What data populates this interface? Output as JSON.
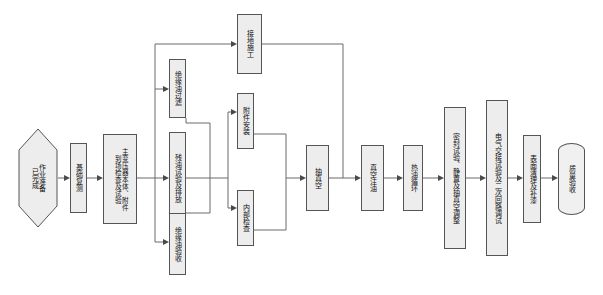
{
  "diagram": {
    "orientation": "left-to-right, vertical CJK text",
    "style": {
      "node_fill": "#ededed",
      "node_border": "#555555",
      "wire_color": "#6b6b6b",
      "arrow_color": "#4a4a4a",
      "background": "#ffffff"
    }
  },
  "nodes": {
    "start": {
      "label": "作业准备\n已完成",
      "shape": "hexagon"
    },
    "n1": {
      "label": "基础复测",
      "shape": "process"
    },
    "n2": {
      "label": "主变压器本体、附件\n到场检查及试验",
      "shape": "process"
    },
    "n3": {
      "label": "接地施工",
      "shape": "process"
    },
    "n4": {
      "label": "绝缘油过滤",
      "shape": "process"
    },
    "n5": {
      "label": "残油试验及排放",
      "shape": "process"
    },
    "n6": {
      "label": "绝缘油验收",
      "shape": "process"
    },
    "n7": {
      "label": "附件安装",
      "shape": "process"
    },
    "n8": {
      "label": "内部检查",
      "shape": "process"
    },
    "n9": {
      "label": "抽真空",
      "shape": "process"
    },
    "n10": {
      "label": "真空注油",
      "shape": "process"
    },
    "n11": {
      "label": "热油循环",
      "shape": "process"
    },
    "n12": {
      "label": "密封试验、静置及抽真空调整",
      "shape": "process"
    },
    "n13": {
      "label": "电气交接试验及二次回路调试",
      "shape": "process"
    },
    "n14": {
      "label": "表面清理及补漆",
      "shape": "process"
    },
    "end": {
      "label": "质量验收",
      "shape": "terminal"
    }
  },
  "edges": [
    {
      "from": "start",
      "to": "n1"
    },
    {
      "from": "n1",
      "to": "n2"
    },
    {
      "from": "n2",
      "to": "n3"
    },
    {
      "from": "n2",
      "to": "n4"
    },
    {
      "from": "n2",
      "to": "n5"
    },
    {
      "from": "n2",
      "to": "n6"
    },
    {
      "from": "n4",
      "to": "n7"
    },
    {
      "from": "n5",
      "to": "n7"
    },
    {
      "from": "n6",
      "to": "n8"
    },
    {
      "from": "n5",
      "to": "n8"
    },
    {
      "from": "n7",
      "to": "n9"
    },
    {
      "from": "n8",
      "to": "n9"
    },
    {
      "from": "n3",
      "to": "n9"
    },
    {
      "from": "n9",
      "to": "n10"
    },
    {
      "from": "n10",
      "to": "n11"
    },
    {
      "from": "n11",
      "to": "n12"
    },
    {
      "from": "n12",
      "to": "n13"
    },
    {
      "from": "n13",
      "to": "n14"
    },
    {
      "from": "n14",
      "to": "end"
    }
  ]
}
